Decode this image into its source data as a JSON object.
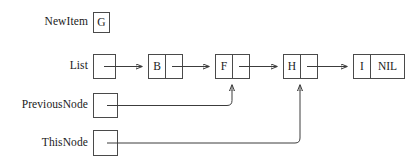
{
  "diagram": {
    "stroke_color": "#3c3c3c",
    "border_color": "#4a4a4a",
    "text_color": "#1a1a1a",
    "background": "#ffffff"
  },
  "rows": {
    "new_item": {
      "label": "NewItem",
      "value": "G"
    },
    "list": {
      "label": "List",
      "pointer_value": ""
    },
    "previous_node": {
      "label": "PreviousNode",
      "pointer_value": "",
      "points_to": "F"
    },
    "this_node": {
      "label": "ThisNode",
      "pointer_value": "",
      "points_to": "H"
    }
  },
  "nodes": [
    {
      "data": "B",
      "link": ""
    },
    {
      "data": "F",
      "link": ""
    },
    {
      "data": "H",
      "link": ""
    },
    {
      "data": "I",
      "link": "NIL"
    }
  ]
}
